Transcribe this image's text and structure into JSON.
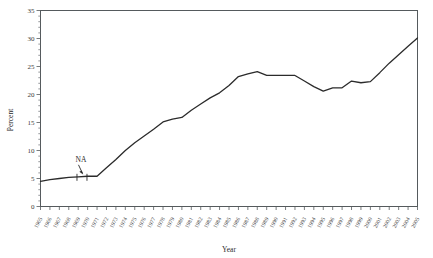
{
  "chart_data": {
    "type": "line",
    "title": "",
    "xlabel": "Year",
    "ylabel": "Percent",
    "ylim": [
      0,
      35
    ],
    "ytick_labels": [
      "0",
      "5",
      "10",
      "15",
      "20",
      "25",
      "30",
      "35"
    ],
    "ytick_values": [
      0,
      5,
      10,
      15,
      20,
      25,
      30,
      35
    ],
    "xlim": [
      1965,
      2005
    ],
    "grid": false,
    "legend": "none",
    "categories": [
      "1965",
      "1966",
      "1967",
      "1968",
      "1969",
      "1970",
      "1971",
      "1972",
      "1973",
      "1974",
      "1975",
      "1976",
      "1977",
      "1978",
      "1979",
      "1980",
      "1981",
      "1982",
      "1983",
      "1984",
      "1985",
      "1986",
      "1987",
      "1988",
      "1989",
      "1990",
      "1991",
      "1992",
      "1993",
      "1994",
      "1995",
      "1996",
      "1997",
      "1998",
      "1999",
      "2000",
      "2001",
      "2002",
      "2003",
      "2004",
      "2005"
    ],
    "series": [
      {
        "name": "Percent",
        "values": [
          4.5,
          4.8,
          5.0,
          5.2,
          5.3,
          5.4,
          5.4,
          6.9,
          8.4,
          10.0,
          11.4,
          12.6,
          13.8,
          15.1,
          15.6,
          15.9,
          17.2,
          18.3,
          19.4,
          20.3,
          21.6,
          23.2,
          23.7,
          24.1,
          23.4,
          23.4,
          23.4,
          23.4,
          22.4,
          21.4,
          20.6,
          21.2,
          21.2,
          22.4,
          22.1,
          22.3,
          23.9,
          25.6,
          27.1,
          28.6,
          30.1
        ]
      }
    ],
    "annotations": [
      {
        "name": "na-gap",
        "label": "NA",
        "x_center": 1969.4,
        "y": 5.3,
        "description": "NA marker with arrow pointing to a break in the series"
      }
    ]
  },
  "axis": {
    "x_title": "Year",
    "y_title": "Percent"
  }
}
